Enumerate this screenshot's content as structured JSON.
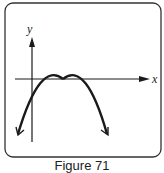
{
  "figure": {
    "caption": "Figure 71",
    "x_label": "x",
    "y_label": "y",
    "curve": "downward-opening parabola tangent to x-axis at vertex",
    "colors": {
      "stroke": "#1a1a1a",
      "frame": "#333333"
    }
  }
}
